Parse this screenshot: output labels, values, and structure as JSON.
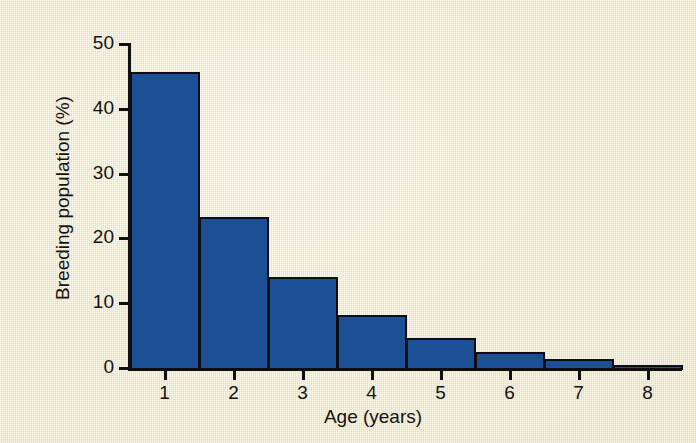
{
  "chart_data": {
    "type": "bar",
    "title": "",
    "subtitle": "",
    "xlabel": "Age (years)",
    "ylabel": "Breeding population (%)",
    "categories": [
      "1",
      "2",
      "3",
      "4",
      "5",
      "6",
      "7",
      "8"
    ],
    "values": [
      46,
      23.6,
      14.3,
      8.5,
      4.9,
      2.8,
      1.7,
      0.8
    ],
    "series": [
      {
        "name": "Breeding population",
        "values": [
          46,
          23.6,
          14.3,
          8.5,
          4.9,
          2.8,
          1.7,
          0.8
        ]
      }
    ],
    "xlim": [
      0.5,
      8.5
    ],
    "ylim": [
      0,
      50
    ],
    "y_ticks": [
      "0",
      "10",
      "20",
      "30",
      "40",
      "50"
    ],
    "y_tick_values": [
      0,
      10,
      20,
      30,
      40,
      50
    ],
    "x_ticks": [
      "1",
      "2",
      "3",
      "4",
      "5",
      "6",
      "7",
      "8"
    ],
    "grid": false,
    "legend": null,
    "legend_position": "none",
    "bar_style": "histogram-contiguous",
    "annotations": [],
    "colors": {
      "bar_fill": "#1d4f96",
      "bar_outline": "#0e0e10",
      "axis": "#111010",
      "background": "#f4edcc",
      "text": "#16130e"
    }
  }
}
